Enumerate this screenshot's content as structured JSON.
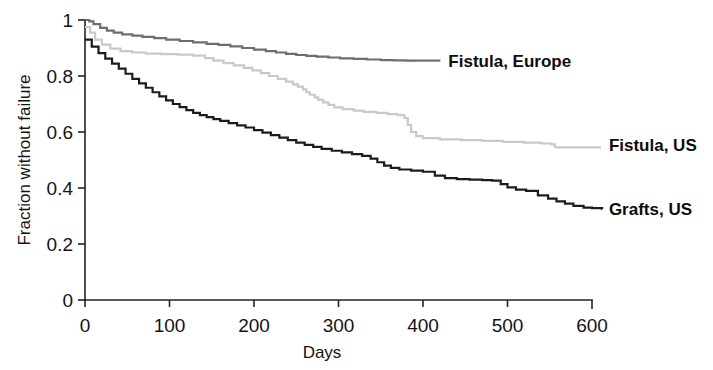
{
  "chart_data": {
    "type": "line",
    "subtype": "kaplan-meier-step",
    "title": "",
    "xlabel": "Days",
    "ylabel": "Fraction without failure",
    "xlim": [
      0,
      600
    ],
    "ylim": [
      0,
      1
    ],
    "xticks": [
      0,
      100,
      200,
      300,
      400,
      500,
      600
    ],
    "xticklabels": [
      "0",
      "100",
      "200",
      "300",
      "400",
      "500",
      "600"
    ],
    "yticks": [
      0,
      0.2,
      0.4,
      0.6,
      0.8,
      1
    ],
    "yticklabels": [
      "0",
      "0.2",
      "0.4",
      "0.6",
      "0.8",
      "1"
    ],
    "grid": false,
    "legend_position": "right-inline-labels",
    "series": [
      {
        "name": "Fistula, Europe",
        "color": "#6e6e6e",
        "linewidth": 2.2,
        "label_x": 430,
        "label_y": 0.855,
        "points": [
          [
            0,
            1.0
          ],
          [
            5,
            0.995
          ],
          [
            10,
            0.985
          ],
          [
            18,
            0.972
          ],
          [
            26,
            0.962
          ],
          [
            34,
            0.955
          ],
          [
            44,
            0.949
          ],
          [
            56,
            0.944
          ],
          [
            68,
            0.94
          ],
          [
            82,
            0.935
          ],
          [
            96,
            0.93
          ],
          [
            112,
            0.925
          ],
          [
            128,
            0.92
          ],
          [
            144,
            0.915
          ],
          [
            158,
            0.911
          ],
          [
            172,
            0.906
          ],
          [
            186,
            0.9
          ],
          [
            200,
            0.894
          ],
          [
            214,
            0.889
          ],
          [
            226,
            0.884
          ],
          [
            238,
            0.879
          ],
          [
            250,
            0.875
          ],
          [
            262,
            0.872
          ],
          [
            274,
            0.869
          ],
          [
            288,
            0.866
          ],
          [
            302,
            0.863
          ],
          [
            318,
            0.861
          ],
          [
            334,
            0.859
          ],
          [
            350,
            0.857
          ],
          [
            366,
            0.856
          ],
          [
            380,
            0.855
          ],
          [
            395,
            0.855
          ]
        ]
      },
      {
        "name": "Fistula, US",
        "color": "#c9c9c9",
        "linewidth": 2.2,
        "label_x": 620,
        "label_y": 0.555,
        "points": [
          [
            0,
            0.975
          ],
          [
            6,
            0.955
          ],
          [
            12,
            0.93
          ],
          [
            20,
            0.912
          ],
          [
            30,
            0.898
          ],
          [
            42,
            0.889
          ],
          [
            56,
            0.884
          ],
          [
            72,
            0.88
          ],
          [
            90,
            0.878
          ],
          [
            110,
            0.876
          ],
          [
            128,
            0.873
          ],
          [
            142,
            0.864
          ],
          [
            152,
            0.855
          ],
          [
            164,
            0.846
          ],
          [
            176,
            0.838
          ],
          [
            188,
            0.829
          ],
          [
            198,
            0.82
          ],
          [
            208,
            0.81
          ],
          [
            218,
            0.8
          ],
          [
            228,
            0.79
          ],
          [
            238,
            0.78
          ],
          [
            246,
            0.77
          ],
          [
            252,
            0.762
          ],
          [
            258,
            0.752
          ],
          [
            262,
            0.742
          ],
          [
            266,
            0.733
          ],
          [
            272,
            0.724
          ],
          [
            276,
            0.715
          ],
          [
            282,
            0.706
          ],
          [
            288,
            0.697
          ],
          [
            295,
            0.688
          ],
          [
            305,
            0.682
          ],
          [
            318,
            0.676
          ],
          [
            330,
            0.672
          ],
          [
            345,
            0.668
          ],
          [
            358,
            0.664
          ],
          [
            370,
            0.66
          ],
          [
            378,
            0.65
          ],
          [
            382,
            0.625
          ],
          [
            386,
            0.6
          ],
          [
            392,
            0.585
          ],
          [
            400,
            0.578
          ],
          [
            420,
            0.574
          ],
          [
            445,
            0.571
          ],
          [
            470,
            0.568
          ],
          [
            495,
            0.565
          ],
          [
            520,
            0.562
          ],
          [
            540,
            0.559
          ],
          [
            552,
            0.556
          ],
          [
            556,
            0.545
          ]
        ]
      },
      {
        "name": "Grafts, US",
        "color": "#1c1c1c",
        "linewidth": 2.2,
        "label_x": 620,
        "label_y": 0.325,
        "points": [
          [
            0,
            0.93
          ],
          [
            8,
            0.905
          ],
          [
            16,
            0.882
          ],
          [
            24,
            0.862
          ],
          [
            32,
            0.844
          ],
          [
            40,
            0.826
          ],
          [
            48,
            0.808
          ],
          [
            56,
            0.79
          ],
          [
            64,
            0.774
          ],
          [
            72,
            0.758
          ],
          [
            80,
            0.742
          ],
          [
            88,
            0.727
          ],
          [
            96,
            0.713
          ],
          [
            104,
            0.7
          ],
          [
            112,
            0.689
          ],
          [
            120,
            0.678
          ],
          [
            128,
            0.668
          ],
          [
            136,
            0.66
          ],
          [
            144,
            0.653
          ],
          [
            152,
            0.646
          ],
          [
            160,
            0.64
          ],
          [
            170,
            0.632
          ],
          [
            180,
            0.624
          ],
          [
            190,
            0.616
          ],
          [
            200,
            0.607
          ],
          [
            210,
            0.598
          ],
          [
            220,
            0.589
          ],
          [
            230,
            0.58
          ],
          [
            240,
            0.571
          ],
          [
            250,
            0.562
          ],
          [
            260,
            0.554
          ],
          [
            270,
            0.547
          ],
          [
            280,
            0.54
          ],
          [
            292,
            0.533
          ],
          [
            304,
            0.527
          ],
          [
            316,
            0.521
          ],
          [
            328,
            0.515
          ],
          [
            338,
            0.505
          ],
          [
            346,
            0.492
          ],
          [
            354,
            0.48
          ],
          [
            362,
            0.472
          ],
          [
            372,
            0.466
          ],
          [
            386,
            0.462
          ],
          [
            400,
            0.458
          ],
          [
            414,
            0.444
          ],
          [
            426,
            0.435
          ],
          [
            440,
            0.432
          ],
          [
            455,
            0.43
          ],
          [
            470,
            0.428
          ],
          [
            482,
            0.426
          ],
          [
            492,
            0.414
          ],
          [
            500,
            0.402
          ],
          [
            510,
            0.394
          ],
          [
            522,
            0.39
          ],
          [
            536,
            0.374
          ],
          [
            548,
            0.362
          ],
          [
            558,
            0.352
          ],
          [
            568,
            0.344
          ],
          [
            578,
            0.336
          ],
          [
            590,
            0.33
          ],
          [
            600,
            0.328
          ],
          [
            612,
            0.325
          ]
        ]
      }
    ]
  },
  "axis": {
    "x_label": "Days",
    "y_label": "Fraction without failure"
  },
  "labels": {
    "fistula_europe": "Fistula, Europe",
    "fistula_us": "Fistula, US",
    "grafts_us": "Grafts, US"
  },
  "colors": {
    "fistula_europe": "#6e6e6e",
    "fistula_us": "#c9c9c9",
    "grafts_us": "#1c1c1c",
    "axis": "#222222",
    "text": "#141414",
    "background": "#ffffff"
  }
}
